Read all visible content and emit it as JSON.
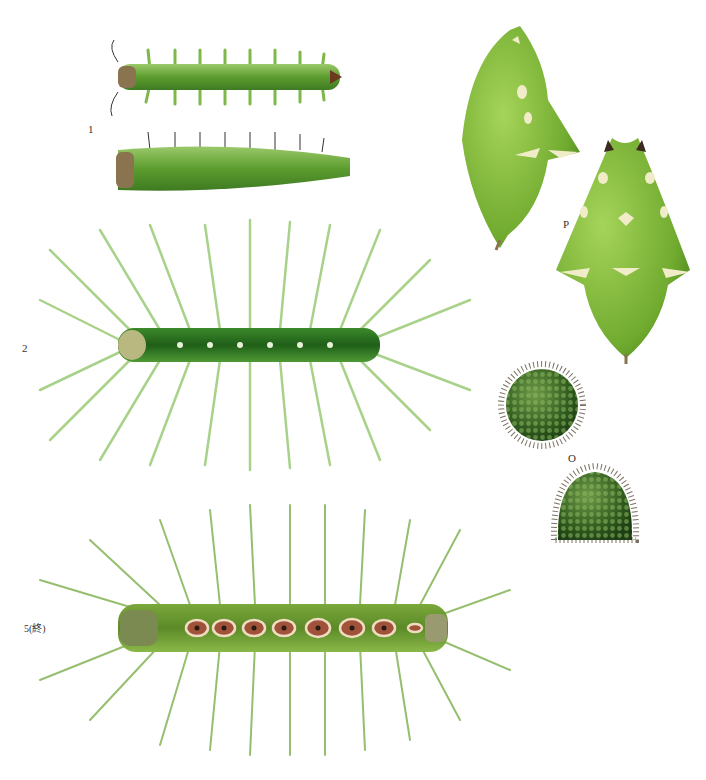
{
  "plate": {
    "labels": {
      "fig1": "1",
      "fig2": "2",
      "fig5": "5(終)",
      "pupa": "P",
      "egg": "O"
    },
    "colors": {
      "body_green": "#6fae3a",
      "dark_green": "#2f6b1c",
      "light_green": "#b8d89a",
      "spot_brown": "#a0523a",
      "spot_cream": "#f0dcc0",
      "egg_green": "#3d6b25"
    }
  }
}
